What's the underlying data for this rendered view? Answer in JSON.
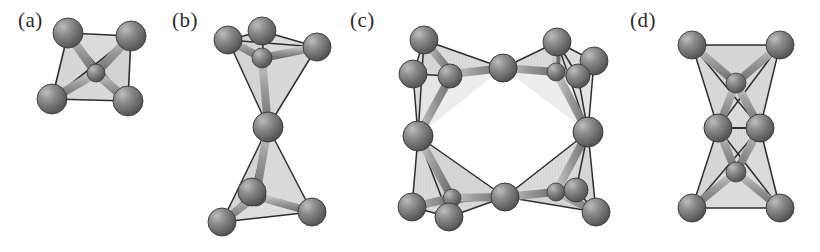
{
  "figure": {
    "background_color": "#ffffff",
    "width": 820,
    "height": 252
  },
  "style": {
    "sphere_fill": "#7d7d7d",
    "sphere_highlight": "#bdbdbd",
    "sphere_shadow": "#4a4a4a",
    "sphere_outline": "#3a3a3a",
    "face_fill": "#d6d6d6",
    "face_fill_dark": "#c2c2c2",
    "edge_color": "#2e2e2e",
    "bond_color": "#9a9a9a",
    "bond_highlight": "#c8c8c8",
    "label_color": "#2b2b2b"
  },
  "panels": [
    {
      "id": "a",
      "label": "(a)",
      "label_x": 18,
      "label_y": 8,
      "description": "single isolated tetrahedron, four vertex spheres",
      "sphere_count": 4,
      "tetrahedra_count": 1,
      "sharing": "none",
      "spheres": [
        {
          "cx": 68,
          "cy": 33,
          "r": 15
        },
        {
          "cx": 131,
          "cy": 36,
          "r": 15
        },
        {
          "cx": 52,
          "cy": 99,
          "r": 15
        },
        {
          "cx": 128,
          "cy": 101,
          "r": 15
        }
      ],
      "center": {
        "cx": 96,
        "cy": 73,
        "r": 9
      }
    },
    {
      "id": "b",
      "label": "(b)",
      "label_x": 172,
      "label_y": 8,
      "description": "two corner-sharing tetrahedra, bowtie arrangement",
      "sphere_count": 7,
      "tetrahedra_count": 2,
      "sharing": "corner",
      "spheres": [
        {
          "cx": 228,
          "cy": 40,
          "r": 14
        },
        {
          "cx": 262,
          "cy": 31,
          "r": 14
        },
        {
          "cx": 317,
          "cy": 47,
          "r": 14
        },
        {
          "cx": 268,
          "cy": 127,
          "r": 15
        },
        {
          "cx": 252,
          "cy": 192,
          "r": 14
        },
        {
          "cx": 222,
          "cy": 222,
          "r": 14
        },
        {
          "cx": 312,
          "cy": 212,
          "r": 14
        }
      ],
      "shared_vertex": {
        "cx": 268,
        "cy": 127
      }
    },
    {
      "id": "c",
      "label": "(c)",
      "label_x": 350,
      "label_y": 8,
      "description": "four-membered ring of corner-sharing tetrahedra",
      "sphere_count": 14,
      "tetrahedra_count": 4,
      "sharing": "corner",
      "spheres": [
        {
          "cx": 424,
          "cy": 40,
          "r": 14
        },
        {
          "cx": 413,
          "cy": 74,
          "r": 14
        },
        {
          "cx": 450,
          "cy": 76,
          "r": 13
        },
        {
          "cx": 503,
          "cy": 68,
          "r": 14
        },
        {
          "cx": 557,
          "cy": 42,
          "r": 14
        },
        {
          "cx": 594,
          "cy": 61,
          "r": 14
        },
        {
          "cx": 578,
          "cy": 76,
          "r": 13
        },
        {
          "cx": 418,
          "cy": 136,
          "r": 15
        },
        {
          "cx": 588,
          "cy": 132,
          "r": 15
        },
        {
          "cx": 412,
          "cy": 207,
          "r": 14
        },
        {
          "cx": 449,
          "cy": 217,
          "r": 14
        },
        {
          "cx": 505,
          "cy": 197,
          "r": 14
        },
        {
          "cx": 576,
          "cy": 190,
          "r": 13
        },
        {
          "cx": 596,
          "cy": 212,
          "r": 14
        }
      ],
      "shared_vertices": [
        {
          "cx": 503,
          "cy": 68
        },
        {
          "cx": 418,
          "cy": 136
        },
        {
          "cx": 588,
          "cy": 132
        },
        {
          "cx": 505,
          "cy": 197
        }
      ]
    },
    {
      "id": "d",
      "label": "(d)",
      "label_x": 630,
      "label_y": 8,
      "description": "two edge-sharing tetrahedra stacked vertically",
      "sphere_count": 6,
      "tetrahedra_count": 2,
      "sharing": "edge",
      "spheres": [
        {
          "cx": 692,
          "cy": 45,
          "r": 14
        },
        {
          "cx": 780,
          "cy": 45,
          "r": 14
        },
        {
          "cx": 736,
          "cy": 83,
          "r": 11
        },
        {
          "cx": 718,
          "cy": 128,
          "r": 14
        },
        {
          "cx": 760,
          "cy": 128,
          "r": 14
        },
        {
          "cx": 736,
          "cy": 172,
          "r": 11
        },
        {
          "cx": 692,
          "cy": 208,
          "r": 14
        },
        {
          "cx": 780,
          "cy": 208,
          "r": 14
        }
      ],
      "shared_edge": [
        {
          "cx": 718,
          "cy": 128
        },
        {
          "cx": 760,
          "cy": 128
        }
      ]
    }
  ]
}
